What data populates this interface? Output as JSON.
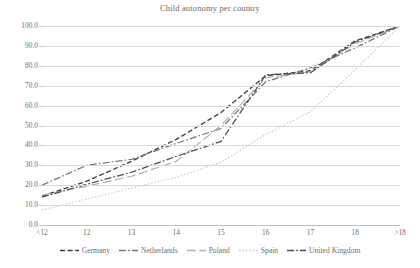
{
  "chart_data": {
    "type": "line",
    "title": "Child autonomy per country",
    "xlabel": "",
    "ylabel": "",
    "categories": [
      "<12",
      "12",
      "13",
      "14",
      "15",
      "16",
      "17",
      "18",
      ">18"
    ],
    "ylim": [
      0,
      100
    ],
    "yticks": [
      "0.0",
      "10.0",
      "20.0",
      "30.0",
      "40.0",
      "50.0",
      "60.0",
      "70.0",
      "80.0",
      "90.0",
      "100.0"
    ],
    "ytick_values": [
      0,
      10,
      20,
      30,
      40,
      50,
      60,
      70,
      80,
      90,
      100
    ],
    "grid": true,
    "legend_position": "bottom",
    "series": [
      {
        "name": "Germany",
        "values": [
          14.5,
          22.0,
          32.0,
          43.0,
          56.5,
          75.0,
          77.5,
          92.5,
          100.0
        ],
        "color": "#3f3f3f",
        "dash": "dashed"
      },
      {
        "name": "Netherlands",
        "values": [
          20.0,
          30.0,
          33.0,
          41.0,
          48.5,
          72.0,
          79.0,
          89.0,
          100.0
        ],
        "color": "#767676",
        "dash": "dash-dot"
      },
      {
        "name": "Poland",
        "values": [
          15.0,
          19.5,
          24.5,
          32.0,
          50.0,
          74.0,
          77.0,
          91.0,
          100.0
        ],
        "color": "#b0b0b0",
        "dash": "long-dash"
      },
      {
        "name": "Spain",
        "values": [
          7.5,
          13.0,
          18.5,
          24.0,
          31.5,
          45.5,
          57.0,
          78.0,
          100.0
        ],
        "color": "#cfcfcf",
        "dash": "dotted"
      },
      {
        "name": "United Kingdom",
        "values": [
          14.0,
          20.5,
          26.5,
          34.5,
          42.0,
          75.5,
          76.5,
          92.0,
          100.0
        ],
        "color": "#4d4d4d",
        "dash": "dash-dot"
      }
    ]
  },
  "colors": {
    "gridline": "#d9d9d9",
    "axis": "#bfbfbf",
    "text": "#6f6f6f",
    "background": "#ffffff"
  }
}
